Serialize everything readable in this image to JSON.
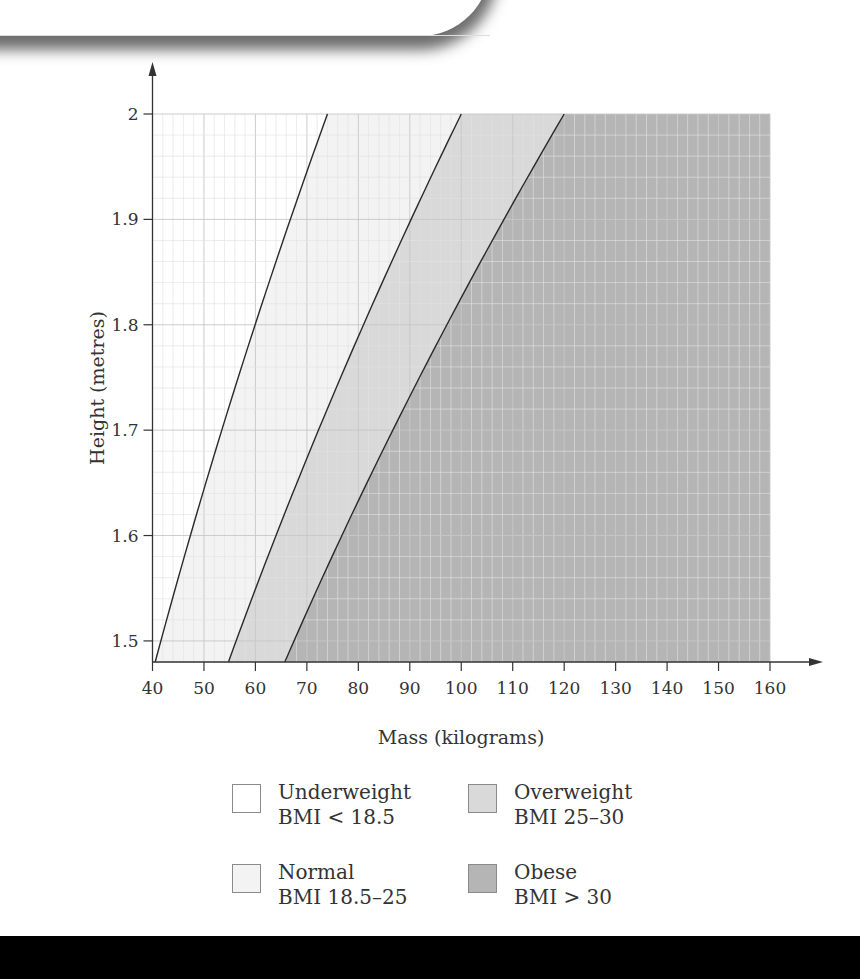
{
  "chart_data": {
    "type": "area",
    "title": "",
    "xlabel": "Mass (kilograms)",
    "ylabel": "Height (metres)",
    "xlim": [
      40,
      160
    ],
    "ylim": [
      1.48,
      2.0
    ],
    "x_ticks": [
      40,
      50,
      60,
      70,
      80,
      90,
      100,
      110,
      120,
      130,
      140,
      150,
      160
    ],
    "y_ticks": [
      "1.5",
      "1.6",
      "1.7",
      "1.8",
      "1.9",
      "2"
    ],
    "y_tick_values": [
      1.5,
      1.6,
      1.7,
      1.8,
      1.9,
      2.0
    ],
    "grid": true,
    "grid_minor_step": {
      "x": 2,
      "y": 0.02
    },
    "boundary_curves": [
      {
        "bmi": 18.5,
        "formula": "mass = 18.5 * height^2",
        "x_at_h1_48": 40.5,
        "x_at_h2_0": 74
      },
      {
        "bmi": 25,
        "formula": "mass = 25 * height^2",
        "x_at_h1_48": 54.8,
        "x_at_h2_0": 100
      },
      {
        "bmi": 30,
        "formula": "mass = 30 * height^2",
        "x_at_h1_48": 65.7,
        "x_at_h2_0": 120
      }
    ],
    "regions": [
      {
        "name": "Underweight",
        "range": "BMI < 18.5",
        "color": "#ffffff"
      },
      {
        "name": "Normal",
        "range": "BMI 18.5–25",
        "color": "#f3f3f3"
      },
      {
        "name": "Overweight",
        "range": "BMI 25–30",
        "color": "#d9d9d9"
      },
      {
        "name": "Obese",
        "range": "BMI > 30",
        "color": "#b5b5b5"
      }
    ],
    "legend_position": "bottom"
  },
  "legend": {
    "items": [
      {
        "label": "Underweight",
        "range": "BMI < 18.5",
        "color": "#ffffff"
      },
      {
        "label": "Overweight",
        "range": "BMI 25–30",
        "color": "#d9d9d9"
      },
      {
        "label": "Normal",
        "range": "BMI 18.5–25",
        "color": "#f3f3f3"
      },
      {
        "label": "Obese",
        "range": "BMI > 30",
        "color": "#b5b5b5"
      }
    ]
  },
  "colors": {
    "axis": "#333333",
    "curve": "#2a2a2a",
    "grid_major": "#c8c8c8",
    "grid_minor": "#e2e2e2",
    "footer": "#000000"
  }
}
